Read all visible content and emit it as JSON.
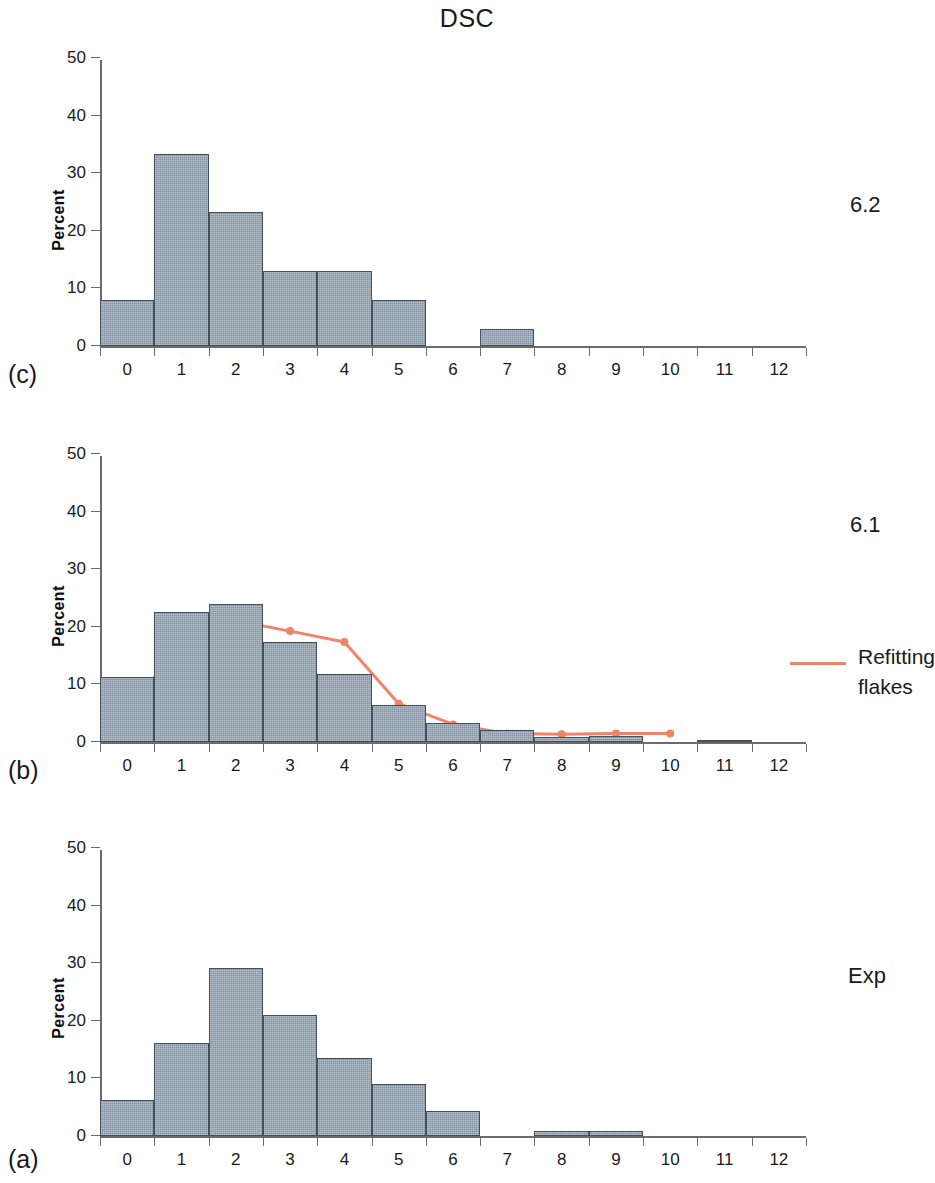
{
  "figure": {
    "title": "DSC",
    "panel_tags": {
      "a": "(a)",
      "b": "(b)",
      "c": "(c)"
    },
    "axis_label_y": "Percent",
    "legend": {
      "label_line1": "Refitting",
      "label_line2": "flakes",
      "color": "#f0836a"
    },
    "colors": {
      "bar_fill": "#8496a6",
      "bar_edge": "#43505c",
      "line": "#f0836a",
      "axis": "#6b6b6b",
      "text": "#1a1a1a"
    },
    "side_labels": {
      "c": "6.2",
      "b": "6.1",
      "a": "Exp"
    }
  },
  "chart_data": [
    {
      "type": "bar",
      "panel": "(c)",
      "title": "DSC",
      "side_label": "6.2",
      "xlabel": "",
      "ylabel": "Percent",
      "categories": [
        "0",
        "1",
        "2",
        "3",
        "4",
        "5",
        "6",
        "7",
        "8",
        "9",
        "10",
        "11",
        "12"
      ],
      "values": [
        8.0,
        33.3,
        23.2,
        13.0,
        13.0,
        8.0,
        0.0,
        3.0,
        0.0,
        0.0,
        0.0,
        0.0,
        0.0
      ],
      "xlim": [
        -0.5,
        12.5
      ],
      "ylim": [
        0,
        50
      ],
      "yticks": [
        0,
        10,
        20,
        30,
        40,
        50
      ],
      "xticks": [
        "0",
        "1",
        "2",
        "3",
        "4",
        "5",
        "6",
        "7",
        "8",
        "9",
        "10",
        "11",
        "12"
      ],
      "grid": false,
      "legend": null
    },
    {
      "type": "bar",
      "panel": "(b)",
      "title": "DSC",
      "side_label": "6.1",
      "xlabel": "",
      "ylabel": "Percent",
      "categories": [
        "0",
        "1",
        "2",
        "3",
        "4",
        "5",
        "6",
        "7",
        "8",
        "9",
        "10",
        "11",
        "12"
      ],
      "values": [
        11.3,
        22.5,
        23.9,
        17.3,
        11.8,
        6.4,
        3.3,
        2.0,
        0.9,
        1.0,
        0.0,
        0.4,
        0.0
      ],
      "xlim": [
        -0.5,
        12.5
      ],
      "ylim": [
        0,
        50
      ],
      "yticks": [
        0,
        10,
        20,
        30,
        40,
        50
      ],
      "xticks": [
        "0",
        "1",
        "2",
        "3",
        "4",
        "5",
        "6",
        "7",
        "8",
        "9",
        "10",
        "11",
        "12"
      ],
      "grid": false,
      "overlay_series": {
        "name": "Refitting flakes",
        "type": "line",
        "color": "#f0836a",
        "marker": "circle",
        "x": [
          0,
          1,
          2,
          3,
          4,
          5,
          6,
          7,
          8,
          9,
          10
        ],
        "values": [
          5.3,
          17.8,
          21.4,
          19.6,
          17.7,
          7.0,
          3.4,
          1.8,
          1.7,
          1.8,
          1.8
        ]
      },
      "legend": {
        "position": "right",
        "entries": [
          "Refitting flakes"
        ]
      }
    },
    {
      "type": "bar",
      "panel": "(a)",
      "title": "DSC",
      "side_label": "Exp",
      "xlabel": "",
      "ylabel": "Percent",
      "categories": [
        "0",
        "1",
        "2",
        "3",
        "4",
        "5",
        "6",
        "7",
        "8",
        "9",
        "10",
        "11",
        "12"
      ],
      "values": [
        6.3,
        16.2,
        29.2,
        21.0,
        13.6,
        9.1,
        4.3,
        0.0,
        0.9,
        0.9,
        0.0,
        0.0,
        0.0
      ],
      "xlim": [
        -0.5,
        12.5
      ],
      "ylim": [
        0,
        50
      ],
      "yticks": [
        0,
        10,
        20,
        30,
        40,
        50
      ],
      "xticks": [
        "0",
        "1",
        "2",
        "3",
        "4",
        "5",
        "6",
        "7",
        "8",
        "9",
        "10",
        "11",
        "12"
      ],
      "grid": false,
      "legend": null
    }
  ]
}
